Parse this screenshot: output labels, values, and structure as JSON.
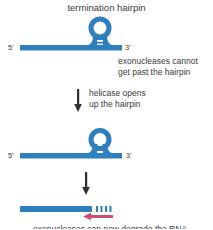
{
  "colors": {
    "rna_blue": "#2f7fbd",
    "arrow_dark": "#2f2f2f",
    "exo_pink": "#d04a70",
    "text_dark": "#3b3b3b"
  },
  "title": "termination hairpin",
  "diagram1": {
    "five_prime": "5'",
    "three_prime": "3'",
    "annotation": "exonucleases cannot\nget past the hairpin"
  },
  "step1": {
    "caption": "helicase opens\nup the hairpin"
  },
  "diagram2": {
    "five_prime": "5'",
    "three_prime": "3'"
  },
  "result": {
    "bottom_caption": "exonucleases can now degrade the RNA"
  }
}
